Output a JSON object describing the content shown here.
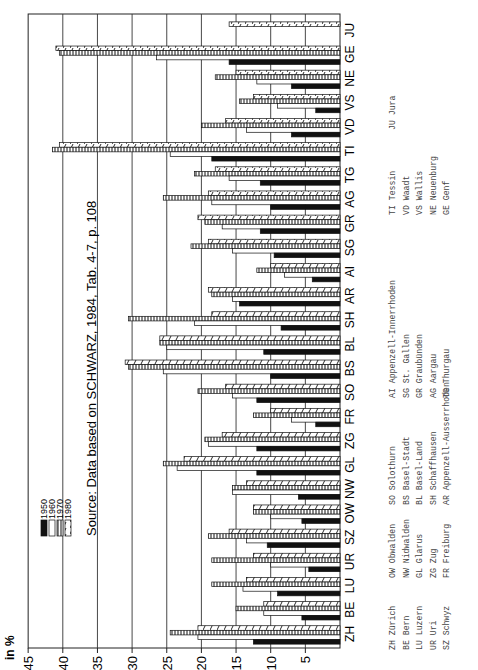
{
  "chart_data": {
    "type": "bar",
    "orientation": "horizontal (page rotated 90°)",
    "title": "",
    "source_note": "Source: Data based on SCHWARZ, 1984, Tab. 4-7, p. 108",
    "ylabel": "in %",
    "xlabel": "",
    "ylim": [
      0,
      45
    ],
    "yticks": [
      5,
      10,
      15,
      20,
      25,
      30,
      35,
      40,
      45
    ],
    "grid": true,
    "legend_position": "upper-left (rotated)",
    "categories": [
      "ZH",
      "BE",
      "LU",
      "UR",
      "SZ",
      "OW",
      "NW",
      "GL",
      "ZG",
      "FR",
      "SO",
      "BS",
      "BL",
      "SH",
      "AR",
      "AI",
      "SG",
      "GR",
      "AG",
      "TG",
      "TI",
      "VD",
      "VS",
      "NE",
      "GE",
      "JU"
    ],
    "series": [
      {
        "name": "1950",
        "pattern": "solid-black",
        "values": [
          12.5,
          5.5,
          9,
          4.5,
          10.5,
          5.5,
          6,
          12,
          12,
          3.5,
          12,
          10,
          11,
          8.5,
          14.5,
          4,
          9.5,
          11.5,
          10,
          11.5,
          18.5,
          7,
          3.5,
          7,
          16,
          null
        ]
      },
      {
        "name": "1960",
        "pattern": "white-outline",
        "values": [
          20.5,
          11,
          14,
          10,
          13.5,
          10,
          15.5,
          23.5,
          19,
          7,
          15.5,
          25.5,
          25,
          21,
          15.5,
          8,
          15.5,
          17,
          18.5,
          16,
          24.5,
          13.5,
          9,
          12,
          26.5,
          null
        ]
      },
      {
        "name": "1970",
        "pattern": "vertical-hatch",
        "values": [
          24.5,
          15,
          18.5,
          18.5,
          19,
          12.5,
          15.5,
          25.5,
          19.5,
          12.5,
          20.5,
          30.5,
          26,
          30.5,
          18.5,
          12,
          21.5,
          19.5,
          25.5,
          21,
          41.5,
          20,
          14.5,
          18,
          40.5,
          null
        ]
      },
      {
        "name": "1980",
        "pattern": "diagonal-hatch",
        "values": [
          20.5,
          11,
          13.5,
          12.5,
          16,
          12.5,
          13.5,
          22.5,
          17,
          10,
          16.5,
          31,
          26,
          18.5,
          19,
          10,
          19,
          20.5,
          19,
          18,
          40.5,
          16.5,
          12.5,
          15,
          41,
          16
        ]
      }
    ]
  },
  "legend": {
    "items": [
      {
        "label": "1950",
        "pattern": "solid-black"
      },
      {
        "label": "1960",
        "pattern": "white-outline"
      },
      {
        "label": "1970",
        "pattern": "vertical-hatch"
      },
      {
        "label": "1980",
        "pattern": "diagonal-hatch"
      }
    ]
  },
  "axis": {
    "unit_label": "in %",
    "ticks": [
      "45",
      "40",
      "35",
      "30",
      "25",
      "20",
      "15",
      "10",
      "5"
    ]
  },
  "source": "Source: Data based on SCHWARZ, 1984, Tab. 4-7, p. 108",
  "key": {
    "columns": [
      [
        "ZH Zürich",
        "BE Bern",
        "LU Luzern",
        "UR Uri",
        "SZ Schwyz"
      ],
      [
        "OW Obwalden",
        "NW Nidwalden",
        "GL Glarus",
        "ZG Zug",
        "FR Freiburg"
      ],
      [
        "SO Solothurn",
        "BS Basel-Stadt",
        "BL Basel-Land",
        "SH Schaffhausen",
        "AR Appenzell-Ausserrhoden"
      ],
      [
        "AI Appenzell-Innerrhoden",
        "SG St. Gallen",
        "GR Graubünden",
        "AG Aargau",
        "TG Thurgau"
      ],
      [
        "TI Tessin",
        "VD Waadt",
        "VS Wallis",
        "NE Neuenburg",
        "GE Genf"
      ],
      [
        "JU Jura"
      ]
    ]
  },
  "colors": {
    "ink": "#111111",
    "paper": "#ffffff",
    "grid": "#333333"
  }
}
